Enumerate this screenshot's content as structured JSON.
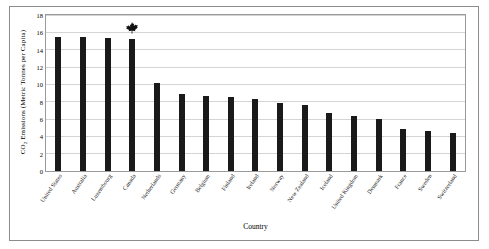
{
  "chart_data": {
    "type": "bar",
    "title": "",
    "xlabel": "Country",
    "ylabel": "CO2 Emissions (Metric Tonnes per Capita)",
    "ylabel_prefix": "CO",
    "ylabel_sub": "2",
    "ylabel_suffix": " Emissions (Metric Tonnes per Capita)",
    "ylim": [
      0,
      18
    ],
    "yticks": [
      0,
      2,
      4,
      6,
      8,
      10,
      12,
      14,
      16,
      18
    ],
    "grid": true,
    "legend": "none",
    "bar_color": "#1a1a1a",
    "categories": [
      "United States",
      "Australia",
      "Luxembourg",
      "Canada",
      "Netherlands",
      "Germany",
      "Belgium",
      "Finland",
      "Ireland",
      "Norway",
      "New Zealand",
      "Iceland",
      "United Kingdom",
      "Denmark",
      "France",
      "Sweden",
      "Switzerland"
    ],
    "values": [
      15.5,
      15.5,
      15.4,
      15.2,
      10.1,
      8.9,
      8.7,
      8.5,
      8.3,
      7.9,
      7.6,
      6.7,
      6.3,
      6.0,
      4.9,
      4.6,
      4.4
    ],
    "annotations": [
      {
        "type": "icon",
        "icon": "maple-leaf-icon",
        "category": "Canada",
        "value": 15.2,
        "color": "#111111"
      }
    ]
  }
}
